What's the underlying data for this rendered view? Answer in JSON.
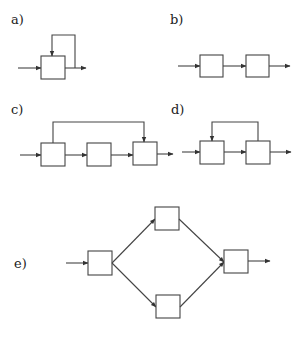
{
  "figure": {
    "panels": [
      {
        "id": "a",
        "label": "a)",
        "description": "Single block with feedback loop from output to its own input"
      },
      {
        "id": "b",
        "label": "b)",
        "description": "Two blocks in series"
      },
      {
        "id": "c",
        "label": "c)",
        "description": "Three blocks in series with feedforward path from first block to third block"
      },
      {
        "id": "d",
        "label": "d)",
        "description": "Two blocks in series with feedback from second block to first block"
      },
      {
        "id": "e",
        "label": "e)",
        "description": "One block splitting into two parallel blocks that merge into a final block"
      }
    ],
    "colors": {
      "line": "#444444",
      "background": "#ffffff",
      "text": "#222222"
    }
  }
}
